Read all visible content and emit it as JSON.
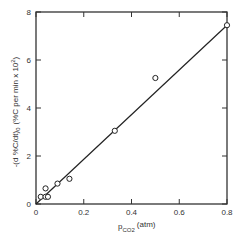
{
  "chart_data": {
    "type": "scatter",
    "title": "",
    "xlabel": "p_CO2 (atm)",
    "xlabel_main": "p",
    "xlabel_sub": "CO2",
    "xlabel_unit": "(atm)",
    "ylabel": "-(d %C/dt)0 (%C per min x 10^2)",
    "ylabel_main": "-(d %C/dt)",
    "ylabel_sub": "0",
    "ylabel_unit": "(%C per min x 10",
    "ylabel_sup": "2",
    "ylabel_close": ")",
    "xlim": [
      0,
      0.8
    ],
    "ylim": [
      0,
      8
    ],
    "xticks": [
      "0",
      "0.2",
      "0.4",
      "0.6",
      "0.8"
    ],
    "yticks": [
      "0",
      "2",
      "4",
      "6",
      "8"
    ],
    "grid": false,
    "legend": null,
    "series": [
      {
        "name": "measured",
        "marker": "open-circle",
        "x": [
          0.02,
          0.04,
          0.04,
          0.05,
          0.09,
          0.14,
          0.33,
          0.5,
          0.8
        ],
        "y": [
          0.3,
          0.3,
          0.65,
          0.3,
          0.85,
          1.05,
          3.05,
          5.25,
          7.45
        ]
      },
      {
        "name": "fit line",
        "type": "line",
        "x": [
          0,
          0.8
        ],
        "y": [
          0,
          7.45
        ]
      }
    ]
  }
}
